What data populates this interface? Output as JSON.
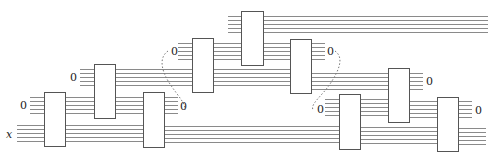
{
  "diagram": {
    "type": "reversible-circuit-bennett-pebbling",
    "colors": {
      "wire": "#8a8a8a",
      "box_stroke": "#555555",
      "box_fill": "#ffffff",
      "dotted": "#777777",
      "text": "#222222"
    },
    "wires_per_bundle": 5,
    "input_label": "x",
    "ancilla_label": "0",
    "boxes": [
      {
        "id": "box-1",
        "x": 44,
        "y": 92,
        "w": 21,
        "h": 54
      },
      {
        "id": "box-2",
        "x": 94,
        "y": 64,
        "w": 21,
        "h": 54
      },
      {
        "id": "box-3",
        "x": 143,
        "y": 92,
        "w": 21,
        "h": 55
      },
      {
        "id": "box-4",
        "x": 192,
        "y": 38,
        "w": 21,
        "h": 54
      },
      {
        "id": "box-5",
        "x": 241,
        "y": 11,
        "w": 22,
        "h": 54
      },
      {
        "id": "box-6",
        "x": 290,
        "y": 39,
        "w": 21,
        "h": 54
      },
      {
        "id": "box-7",
        "x": 339,
        "y": 94,
        "w": 21,
        "h": 55
      },
      {
        "id": "box-8",
        "x": 388,
        "y": 68,
        "w": 21,
        "h": 54
      },
      {
        "id": "box-9",
        "x": 437,
        "y": 97,
        "w": 21,
        "h": 54
      }
    ],
    "bundles": [
      {
        "x1": 17,
        "x2": 44,
        "y": 125
      },
      {
        "x1": 30,
        "x2": 44,
        "y": 97
      },
      {
        "x1": 65,
        "x2": 94,
        "y": 97
      },
      {
        "x1": 65,
        "x2": 143,
        "y": 125
      },
      {
        "x1": 80,
        "x2": 94,
        "y": 69
      },
      {
        "x1": 115,
        "x2": 192,
        "y": 69
      },
      {
        "x1": 115,
        "x2": 143,
        "y": 97
      },
      {
        "x1": 164,
        "x2": 178,
        "y": 97
      },
      {
        "x1": 164,
        "x2": 339,
        "y": 126
      },
      {
        "x1": 178,
        "x2": 192,
        "y": 43
      },
      {
        "x1": 213,
        "x2": 241,
        "y": 43
      },
      {
        "x1": 213,
        "x2": 290,
        "y": 69
      },
      {
        "x1": 228,
        "x2": 241,
        "y": 16
      },
      {
        "x1": 263,
        "x2": 488,
        "y": 16
      },
      {
        "x1": 263,
        "x2": 290,
        "y": 43
      },
      {
        "x1": 311,
        "x2": 325,
        "y": 43
      },
      {
        "x1": 311,
        "x2": 388,
        "y": 73
      },
      {
        "x1": 325,
        "x2": 339,
        "y": 99
      },
      {
        "x1": 360,
        "x2": 388,
        "y": 99
      },
      {
        "x1": 360,
        "x2": 437,
        "y": 127
      },
      {
        "x1": 409,
        "x2": 423,
        "y": 73
      },
      {
        "x1": 409,
        "x2": 437,
        "y": 101
      },
      {
        "x1": 458,
        "x2": 472,
        "y": 101
      },
      {
        "x1": 458,
        "x2": 486,
        "y": 128
      }
    ],
    "labels": [
      {
        "id": "label-x",
        "text": "x",
        "x": 6,
        "y": 138,
        "italic": true
      },
      {
        "id": "label-zero-1",
        "text": "0",
        "x": 20,
        "y": 109
      },
      {
        "id": "label-zero-2",
        "text": "0",
        "x": 70,
        "y": 81
      },
      {
        "id": "label-zero-3",
        "text": "0",
        "x": 171,
        "y": 55
      },
      {
        "id": "label-zero-4",
        "text": "0",
        "x": 180,
        "y": 110
      },
      {
        "id": "label-zero-5",
        "text": "0",
        "x": 327,
        "y": 55
      },
      {
        "id": "label-zero-6",
        "text": "0",
        "x": 317,
        "y": 113
      },
      {
        "id": "label-zero-7",
        "text": "0",
        "x": 426,
        "y": 85
      },
      {
        "id": "label-zero-8",
        "text": "0",
        "x": 475,
        "y": 114
      }
    ],
    "dotted_links": [
      {
        "id": "dotted-link-left",
        "d": "M168,51 C158,58 162,72 170,84 C178,96 186,104 185,110"
      },
      {
        "id": "dotted-link-right",
        "d": "M335,51 C345,58 338,72 330,84 C322,96 310,104 313,110"
      }
    ]
  }
}
